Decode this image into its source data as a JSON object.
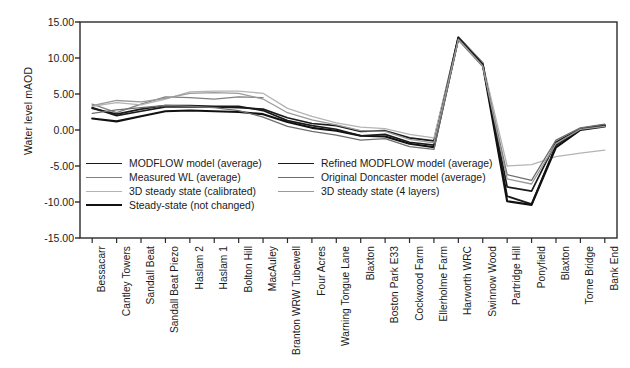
{
  "chart_data": {
    "type": "line",
    "title": "",
    "xlabel": "",
    "ylabel": "Water level mAOD",
    "ylim": [
      -15.0,
      15.0
    ],
    "yticks": [
      15.0,
      10.0,
      5.0,
      0.0,
      -5.0,
      -10.0,
      -15.0
    ],
    "ytick_labels": [
      "15.00",
      "10.00",
      "5.00",
      "0.00",
      "-5.00",
      "-10.00",
      "-15.00"
    ],
    "grid": false,
    "legend_position": "inside-lower-left",
    "categories": [
      "Bessacarr",
      "Cantley Towers",
      "Sandall Beat",
      "Sandall Beat Piezo",
      "Haslam 2",
      "Haslam 1",
      "Bolton Hill",
      "MacAuley",
      "Branton WRW Tubewell",
      "Four Acres",
      "Warning Tongue Lane",
      "Blaxton",
      "Boston Park E33",
      "Cockwood Farm",
      "Ellerholme Farm",
      "Harworth WRC",
      "Swinnow Wood",
      "Partridge Hill",
      "Ponyfield",
      "Blaxton",
      "Torne Bridge",
      "Bank End"
    ],
    "series": [
      {
        "name": "MODFLOW model (average)",
        "color": "#1a1a1a",
        "width": 1.7,
        "values": [
          3.1,
          2.0,
          2.6,
          3.2,
          3.2,
          3.2,
          3.1,
          2.9,
          1.7,
          0.9,
          0.6,
          -0.2,
          -0.1,
          -1.1,
          -1.5,
          12.9,
          9.3,
          -9.2,
          -10.3,
          -2.1,
          0.1,
          0.6
        ]
      },
      {
        "name": "Measured WL (average)",
        "color": "#808080",
        "width": 1.3,
        "values": [
          3.6,
          2.4,
          3.6,
          4.6,
          4.5,
          4.3,
          4.6,
          4.5,
          null,
          null,
          null,
          null,
          null,
          null,
          null,
          null,
          null,
          null,
          null,
          null,
          null,
          null
        ]
      },
      {
        "name": "3D steady state (calibrated)",
        "color": "#b4b4b4",
        "width": 1.3,
        "values": [
          3.3,
          3.8,
          3.5,
          4.3,
          5.3,
          5.4,
          5.4,
          5.1,
          3.0,
          1.9,
          1.0,
          0.4,
          0.2,
          -0.6,
          -1.1,
          12.9,
          9.3,
          -5.0,
          -4.8,
          -3.7,
          -3.2,
          -2.8
        ]
      },
      {
        "name": "Steady-state (not changed)",
        "color": "#111111",
        "width": 2.1,
        "values": [
          1.6,
          1.2,
          1.9,
          2.6,
          2.7,
          2.6,
          2.5,
          2.2,
          1.1,
          0.3,
          -0.1,
          -0.8,
          -0.9,
          -1.9,
          -2.4,
          12.8,
          9.1,
          -9.9,
          -10.4,
          -2.4,
          0.0,
          0.5
        ]
      },
      {
        "name": "Refined MODFLOW model (average)",
        "color": "#1a1a1a",
        "width": 1.7,
        "values": [
          3.0,
          2.2,
          2.9,
          3.4,
          3.4,
          3.3,
          3.3,
          2.7,
          1.3,
          0.6,
          0.1,
          -0.8,
          -0.6,
          -1.7,
          -2.1,
          12.7,
          9.0,
          -7.9,
          -8.5,
          -1.7,
          0.2,
          0.7
        ]
      },
      {
        "name": "Original Doncaster model (average)",
        "color": "#6e6e6e",
        "width": 1.3,
        "values": [
          2.3,
          2.8,
          3.1,
          3.4,
          3.3,
          3.1,
          2.7,
          1.8,
          0.5,
          -0.2,
          -0.7,
          -1.4,
          -1.2,
          -2.3,
          -2.7,
          12.5,
          8.8,
          -6.2,
          -7.0,
          -1.4,
          0.3,
          0.8
        ]
      },
      {
        "name": "3D steady state (4 layers)",
        "color": "#9a9a9a",
        "width": 1.3,
        "values": [
          3.4,
          4.1,
          3.9,
          4.4,
          5.1,
          5.2,
          5.1,
          4.3,
          2.4,
          1.4,
          0.7,
          -0.1,
          -0.2,
          -1.3,
          -1.8,
          12.6,
          8.9,
          -6.8,
          -7.5,
          -1.9,
          0.1,
          0.5
        ]
      }
    ]
  },
  "legend": {
    "left_column": [
      {
        "label": "MODFLOW model (average)",
        "color": "#1a1a1a",
        "width": 1.7
      },
      {
        "label": "Measured WL (average)",
        "color": "#808080",
        "width": 1.3
      },
      {
        "label": "3D steady state (calibrated)",
        "color": "#b4b4b4",
        "width": 1.3
      },
      {
        "label": "Steady-state (not changed)",
        "color": "#111111",
        "width": 2.1
      }
    ],
    "right_column": [
      {
        "label": "Refined MODFLOW model (average)",
        "color": "#1a1a1a",
        "width": 1.7
      },
      {
        "label": "Original Doncaster model (average)",
        "color": "#6e6e6e",
        "width": 1.3
      },
      {
        "label": "3D steady state (4 layers)",
        "color": "#9a9a9a",
        "width": 1.3
      }
    ]
  },
  "axes": {
    "frame_color": "#2b2b2b"
  }
}
